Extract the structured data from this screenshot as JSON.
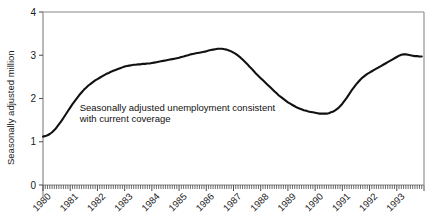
{
  "chart_data": {
    "type": "line",
    "title": "",
    "subtitle": "",
    "xlabel": "",
    "ylabel": "Seasonally adjusted million",
    "xlim": [
      1980.0,
      1994.0
    ],
    "ylim": [
      0,
      4
    ],
    "yticks": [
      0,
      1,
      2,
      3,
      4
    ],
    "ytick_labels": [
      "0",
      "1",
      "2",
      "3",
      "4"
    ],
    "xticks": [
      1980,
      1981,
      1982,
      1983,
      1984,
      1985,
      1986,
      1987,
      1988,
      1989,
      1990,
      1991,
      1992,
      1993
    ],
    "xtick_labels": [
      "1980",
      "1981",
      "1982",
      "1983",
      "1984",
      "1985",
      "1986",
      "1987",
      "1988",
      "1989",
      "1990",
      "1991",
      "1992",
      "1993"
    ],
    "minor_ticks": "monthly",
    "grid": false,
    "legend": false,
    "legend_position": "none",
    "annotations": [
      {
        "name": "series-annotation",
        "line1": "Seasonally adjusted unemployment consistent",
        "line2": "with current coverage",
        "x": 1981.35,
        "y": 1.72
      }
    ],
    "series": [
      {
        "name": "Seasonally adjusted unemployment consistent with current coverage",
        "color": "#111111",
        "units": "million",
        "x": [
          1980.0,
          1980.0833,
          1980.1667,
          1980.25,
          1980.3333,
          1980.4167,
          1980.5,
          1980.5833,
          1980.6667,
          1980.75,
          1980.8333,
          1980.9167,
          1981.0,
          1981.0833,
          1981.1667,
          1981.25,
          1981.3333,
          1981.4167,
          1981.5,
          1981.5833,
          1981.6667,
          1981.75,
          1981.8333,
          1981.9167,
          1982.0,
          1982.0833,
          1982.1667,
          1982.25,
          1982.3333,
          1982.4167,
          1982.5,
          1982.5833,
          1982.6667,
          1982.75,
          1982.8333,
          1982.9167,
          1983.0,
          1983.0833,
          1983.1667,
          1983.25,
          1983.3333,
          1983.4167,
          1983.5,
          1983.5833,
          1983.6667,
          1983.75,
          1983.8333,
          1983.9167,
          1984.0,
          1984.0833,
          1984.1667,
          1984.25,
          1984.3333,
          1984.4167,
          1984.5,
          1984.5833,
          1984.6667,
          1984.75,
          1984.8333,
          1984.9167,
          1985.0,
          1985.0833,
          1985.1667,
          1985.25,
          1985.3333,
          1985.4167,
          1985.5,
          1985.5833,
          1985.6667,
          1985.75,
          1985.8333,
          1985.9167,
          1986.0,
          1986.0833,
          1986.1667,
          1986.25,
          1986.3333,
          1986.4167,
          1986.5,
          1986.5833,
          1986.6667,
          1986.75,
          1986.8333,
          1986.9167,
          1987.0,
          1987.0833,
          1987.1667,
          1987.25,
          1987.3333,
          1987.4167,
          1987.5,
          1987.5833,
          1987.6667,
          1987.75,
          1987.8333,
          1987.9167,
          1988.0,
          1988.0833,
          1988.1667,
          1988.25,
          1988.3333,
          1988.4167,
          1988.5,
          1988.5833,
          1988.6667,
          1988.75,
          1988.8333,
          1988.9167,
          1989.0,
          1989.0833,
          1989.1667,
          1989.25,
          1989.3333,
          1989.4167,
          1989.5,
          1989.5833,
          1989.6667,
          1989.75,
          1989.8333,
          1989.9167,
          1990.0,
          1990.0833,
          1990.1667,
          1990.25,
          1990.3333,
          1990.4167,
          1990.5,
          1990.5833,
          1990.6667,
          1990.75,
          1990.8333,
          1990.9167,
          1991.0,
          1991.0833,
          1991.1667,
          1991.25,
          1991.3333,
          1991.4167,
          1991.5,
          1991.5833,
          1991.6667,
          1991.75,
          1991.8333,
          1991.9167,
          1992.0,
          1992.0833,
          1992.1667,
          1992.25,
          1992.3333,
          1992.4167,
          1992.5,
          1992.5833,
          1992.6667,
          1992.75,
          1992.8333,
          1992.9167,
          1993.0,
          1993.0833,
          1993.1667,
          1993.25,
          1993.3333,
          1993.4167,
          1993.5,
          1993.5833,
          1993.6667,
          1993.75,
          1993.8333,
          1993.9167
        ],
        "y": [
          1.12,
          1.13,
          1.15,
          1.18,
          1.22,
          1.27,
          1.33,
          1.4,
          1.47,
          1.55,
          1.63,
          1.71,
          1.79,
          1.87,
          1.94,
          2.01,
          2.08,
          2.14,
          2.2,
          2.25,
          2.3,
          2.34,
          2.38,
          2.42,
          2.45,
          2.48,
          2.51,
          2.54,
          2.57,
          2.59,
          2.62,
          2.64,
          2.66,
          2.68,
          2.7,
          2.72,
          2.74,
          2.75,
          2.76,
          2.77,
          2.78,
          2.78,
          2.79,
          2.79,
          2.8,
          2.8,
          2.81,
          2.81,
          2.82,
          2.83,
          2.84,
          2.85,
          2.86,
          2.87,
          2.88,
          2.89,
          2.9,
          2.91,
          2.92,
          2.93,
          2.94,
          2.96,
          2.97,
          2.99,
          3.0,
          3.02,
          3.03,
          3.04,
          3.05,
          3.06,
          3.07,
          3.08,
          3.09,
          3.11,
          3.12,
          3.13,
          3.14,
          3.15,
          3.15,
          3.15,
          3.14,
          3.13,
          3.11,
          3.09,
          3.06,
          3.03,
          2.99,
          2.95,
          2.9,
          2.85,
          2.8,
          2.74,
          2.69,
          2.63,
          2.57,
          2.52,
          2.47,
          2.42,
          2.37,
          2.32,
          2.27,
          2.22,
          2.17,
          2.12,
          2.07,
          2.03,
          1.99,
          1.95,
          1.91,
          1.88,
          1.85,
          1.82,
          1.79,
          1.77,
          1.75,
          1.73,
          1.72,
          1.7,
          1.69,
          1.68,
          1.67,
          1.66,
          1.65,
          1.65,
          1.65,
          1.65,
          1.66,
          1.68,
          1.7,
          1.73,
          1.77,
          1.82,
          1.88,
          1.95,
          2.02,
          2.1,
          2.18,
          2.25,
          2.32,
          2.38,
          2.44,
          2.49,
          2.53,
          2.57,
          2.6,
          2.63,
          2.66,
          2.69,
          2.72,
          2.75,
          2.78,
          2.81,
          2.84,
          2.87,
          2.9,
          2.93,
          2.96,
          2.99,
          3.01,
          3.02,
          3.02,
          3.01,
          3.0,
          2.99,
          2.98,
          2.98,
          2.97,
          2.97
        ]
      }
    ]
  }
}
